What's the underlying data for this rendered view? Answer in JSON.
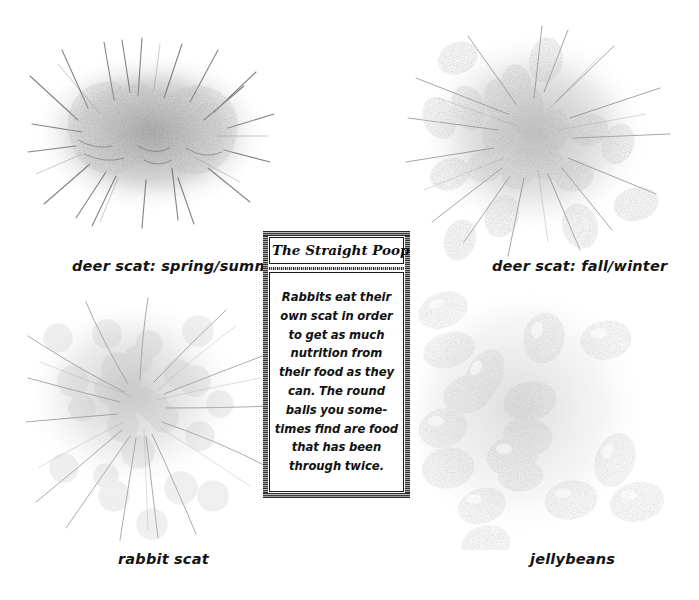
{
  "page": {
    "background_color": "#ffffff",
    "width": 699,
    "height": 600,
    "medium": "graphite pencil illustration"
  },
  "sidebar_box": {
    "title": "The Straight Poop",
    "body": "Rabbits eat their own scat in order to get as much nutrition from their food as they can. The round balls you some-times find are food that has been through twice.",
    "border_color": "#1a1a1a",
    "background_color": "#ffffff"
  },
  "figures": [
    {
      "id": "deer-scat-spring-summer",
      "caption": "deer scat: spring/summer",
      "description": "clumped mass of lobed deer pellets fused into a single blob with radiating pencil hatch strokes",
      "position": "top-left",
      "tone": "#6e6e6e"
    },
    {
      "id": "deer-scat-fall-winter",
      "caption": "deer scat: fall/winter",
      "description": "scattered pile of separate oval deer pellets over a hatched ground shadow",
      "position": "top-right",
      "tone": "#7a7a7a"
    },
    {
      "id": "rabbit-scat",
      "caption": "rabbit scat",
      "description": "scattered cluster of small round rabbit pellets over radiating grass strokes",
      "position": "bottom-left",
      "tone": "#8a8a8a"
    },
    {
      "id": "jellybeans",
      "caption": "jellybeans",
      "description": "loose scatter of bean-shaped jellybeans in assorted light and dark tones",
      "position": "bottom-right",
      "tone": "#9a9a9a"
    }
  ],
  "captions": {
    "spring_summer": "deer scat: spring/summer",
    "fall_winter": "deer scat: fall/winter",
    "rabbit": "rabbit scat",
    "jellybeans": "jellybeans"
  }
}
